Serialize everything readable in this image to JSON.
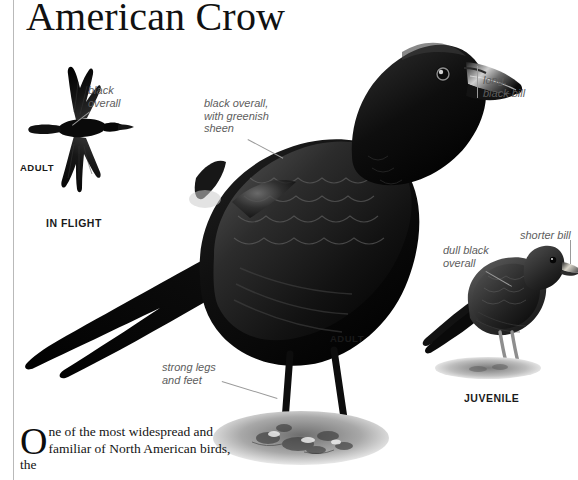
{
  "page": {
    "title": "American Crow",
    "background": "#ffffff",
    "rule_color": "#b9b9b9",
    "label_color": "#5d5d5d",
    "caption_color": "#1a1a1a",
    "leader_color": "#9a9a9a"
  },
  "labels": {
    "flight_black_overall": "black\noverall",
    "adult_black_greenish": "black overall,\nwith greenish\nsheen",
    "long_black_bill": "long,\nblack bill",
    "strong_legs_feet": "strong legs\nand feet",
    "juv_dull_black": "dull black\noverall",
    "juv_shorter_bill": "shorter bill"
  },
  "captions": {
    "flight_adult": "ADULT",
    "in_flight": "IN FLIGHT",
    "main_adult": "ADULT",
    "juvenile": "JUVENILE"
  },
  "body": {
    "dropcap": "O",
    "paragraph": "ne of the most widespread and familiar of North American birds, the"
  },
  "figures": {
    "flight_bird": "crow-in-flight-illustration",
    "main_bird": "crow-adult-perched-illustration",
    "juvenile_bird": "crow-juvenile-illustration",
    "ground_main": "rocky-ground-patch",
    "ground_juvenile": "ground-shadow-patch"
  }
}
